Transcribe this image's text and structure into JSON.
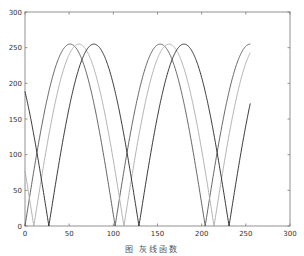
{
  "caption": "图      灰线函数",
  "chart_data": {
    "type": "line",
    "title": "",
    "xlabel": "",
    "ylabel": "",
    "xlim": [
      0,
      300
    ],
    "ylim": [
      0,
      300
    ],
    "grid": false,
    "legend": null,
    "x_ticks": [
      0,
      50,
      100,
      150,
      200,
      250,
      300
    ],
    "y_ticks": [
      0,
      50,
      100,
      150,
      200,
      250,
      300
    ],
    "x_tick_labels": [
      "0",
      "50",
      "100",
      "150",
      "200",
      "250",
      "300"
    ],
    "y_tick_labels": [
      "0",
      "50",
      "100",
      "150",
      "200",
      "250",
      "300"
    ],
    "x_range": [
      0,
      255
    ],
    "series": [
      {
        "name": "curve-1",
        "color": "#555555",
        "formula": "255*|sin(pi*x/102)|",
        "phase_shift": 0,
        "x": [
          0,
          25,
          51,
          76,
          102,
          127,
          153,
          178,
          204,
          229,
          255
        ],
        "values": [
          0,
          178,
          255,
          180,
          0,
          176,
          255,
          182,
          0,
          174,
          255
        ]
      },
      {
        "name": "curve-2",
        "color": "#aaaaaa",
        "formula": "255*|sin(pi*(x-10)/102)|",
        "phase_shift": 10,
        "x": [
          0,
          10,
          35,
          61,
          86,
          112,
          137,
          163,
          188,
          214,
          239,
          255
        ],
        "values": [
          77,
          0,
          178,
          255,
          180,
          0,
          176,
          255,
          182,
          0,
          174,
          243
        ]
      },
      {
        "name": "curve-3",
        "color": "#222222",
        "formula": "255*|sin(pi*(x-27)/102)|",
        "phase_shift": 27,
        "x": [
          0,
          27,
          52,
          78,
          103,
          129,
          154,
          180,
          205,
          231,
          255
        ],
        "values": [
          188,
          0,
          178,
          255,
          180,
          0,
          176,
          255,
          182,
          0,
          167
        ]
      }
    ]
  }
}
